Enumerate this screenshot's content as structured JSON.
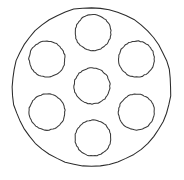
{
  "document": {
    "title": "Circular Plate With Seven Holes",
    "kind": "line-drawing",
    "canvas": {
      "width": 184,
      "height": 180
    },
    "background_color": "#ffffff"
  },
  "style": {
    "outer_stroke_color": "#2b2b2b",
    "hole_stroke_color": "#3a3a3a",
    "fill_color": "#ffffff",
    "stroke_width": 1.05,
    "line_quality": "hand-drawn-irregular"
  },
  "chart_data": {
    "type": "diagram",
    "shapes": [
      {
        "name": "outer-boundary-circle",
        "role": "plate-outline",
        "cx": 91.5,
        "cy": 87.0,
        "r": 79.5,
        "stroke": "#2b2b2b",
        "fill": "none"
      },
      {
        "name": "hole-center",
        "role": "hole",
        "position": "center",
        "cx": 92.0,
        "cy": 86.0,
        "r": 18.0,
        "stroke": "#3a3a3a",
        "fill": "#ffffff"
      },
      {
        "name": "hole-top",
        "role": "hole",
        "position": "top",
        "cx": 93.0,
        "cy": 32.5,
        "r": 18.0,
        "stroke": "#3a3a3a",
        "fill": "#ffffff"
      },
      {
        "name": "hole-upper-right",
        "role": "hole",
        "position": "upper-right",
        "cx": 136.5,
        "cy": 59.0,
        "r": 18.0,
        "stroke": "#3a3a3a",
        "fill": "#ffffff"
      },
      {
        "name": "hole-lower-right",
        "role": "hole",
        "position": "lower-right",
        "cx": 136.5,
        "cy": 112.0,
        "r": 18.0,
        "stroke": "#3a3a3a",
        "fill": "#ffffff"
      },
      {
        "name": "hole-bottom",
        "role": "hole",
        "position": "bottom",
        "cx": 93.0,
        "cy": 138.0,
        "r": 18.0,
        "stroke": "#3a3a3a",
        "fill": "#ffffff"
      },
      {
        "name": "hole-lower-left",
        "role": "hole",
        "position": "lower-left",
        "cx": 47.0,
        "cy": 112.0,
        "r": 18.0,
        "stroke": "#3a3a3a",
        "fill": "#ffffff"
      },
      {
        "name": "hole-upper-left",
        "role": "hole",
        "position": "upper-left",
        "cx": 47.0,
        "cy": 59.0,
        "r": 18.0,
        "stroke": "#3a3a3a",
        "fill": "#ffffff"
      }
    ],
    "counts": {
      "outer_circles": 1,
      "inner_circles": 7,
      "ring_circles": 6,
      "center_circles": 1
    },
    "labels": [],
    "annotations": []
  }
}
